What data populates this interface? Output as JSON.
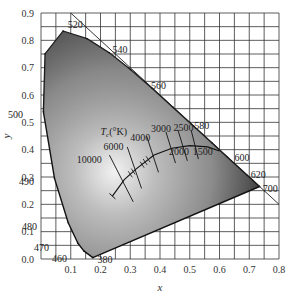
{
  "chart_data": {
    "type": "diagram",
    "xlabel": "x",
    "ylabel": "y",
    "xlim": [
      0,
      0.8
    ],
    "ylim": [
      0,
      0.9
    ],
    "grid": true,
    "grid_step": 0.05,
    "x_ticks": [
      "0.1",
      "0.2",
      "0.3",
      "0.4",
      "0.5",
      "0.6",
      "0.7",
      "0.8"
    ],
    "y_ticks": [
      "0.0",
      "0.1",
      "0.2",
      "0.3",
      "0.4",
      "0.5",
      "0.6",
      "0.7",
      "0.8",
      "0.9"
    ],
    "spectral_locus_labels": [
      "460",
      "470",
      "480",
      "490",
      "500",
      "520",
      "540",
      "560",
      "580",
      "600",
      "620",
      "700",
      "380"
    ],
    "spectral_locus": [
      {
        "nm": 380,
        "x": 0.1741,
        "y": 0.005
      },
      {
        "nm": 460,
        "x": 0.144,
        "y": 0.0297
      },
      {
        "nm": 470,
        "x": 0.1241,
        "y": 0.0578
      },
      {
        "nm": 480,
        "x": 0.0913,
        "y": 0.1327
      },
      {
        "nm": 490,
        "x": 0.0454,
        "y": 0.295
      },
      {
        "nm": 500,
        "x": 0.0082,
        "y": 0.5384
      },
      {
        "nm": 510,
        "x": 0.0139,
        "y": 0.7502
      },
      {
        "nm": 520,
        "x": 0.0743,
        "y": 0.8338
      },
      {
        "nm": 530,
        "x": 0.1547,
        "y": 0.8059
      },
      {
        "nm": 540,
        "x": 0.2296,
        "y": 0.7543
      },
      {
        "nm": 550,
        "x": 0.3016,
        "y": 0.6923
      },
      {
        "nm": 560,
        "x": 0.3731,
        "y": 0.6245
      },
      {
        "nm": 570,
        "x": 0.4441,
        "y": 0.5547
      },
      {
        "nm": 580,
        "x": 0.5125,
        "y": 0.4866
      },
      {
        "nm": 590,
        "x": 0.5752,
        "y": 0.4242
      },
      {
        "nm": 600,
        "x": 0.627,
        "y": 0.3725
      },
      {
        "nm": 620,
        "x": 0.6915,
        "y": 0.3083
      },
      {
        "nm": 700,
        "x": 0.7347,
        "y": 0.2653
      }
    ],
    "planckian_locus_label": "Tc(°K)",
    "planckian_locus_temps": [
      "10000",
      "6000",
      "4000",
      "3000",
      "2500",
      "2000",
      "1500"
    ],
    "annotations": [
      "x + y = 1 diagonal line"
    ]
  },
  "labels": {
    "x_axis": "x",
    "y_axis": "y",
    "tc": "T",
    "tc_sub": "c",
    "tc_unit": "(°K)"
  }
}
